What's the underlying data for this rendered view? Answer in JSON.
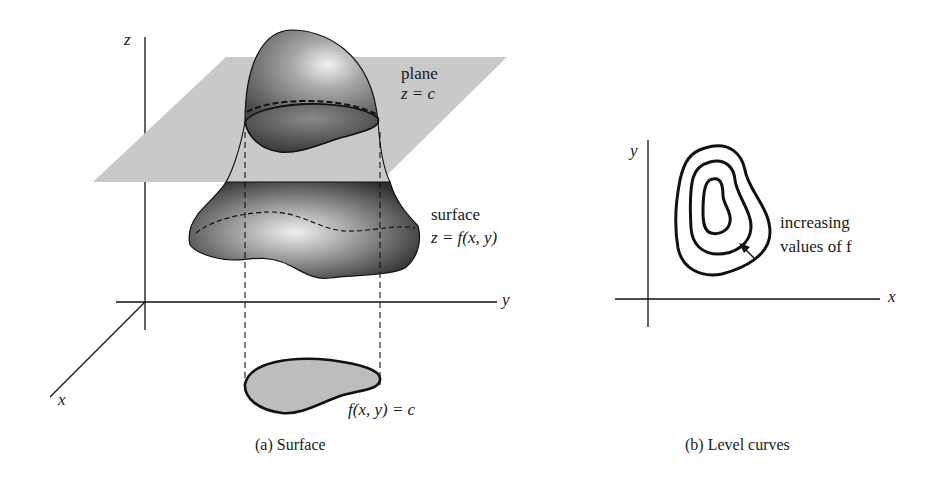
{
  "figure": {
    "panel_a": {
      "caption": "(a) Surface",
      "axes": {
        "z_label": "z",
        "y_label": "y",
        "x_label": "x"
      },
      "plane_label": "plane",
      "plane_equation": "z = c",
      "surface_label": "surface",
      "surface_equation": "z = f(x, y)",
      "level_curve_equation": "f(x, y) = c"
    },
    "panel_b": {
      "caption": "(b) Level curves",
      "axes": {
        "y_label": "y",
        "x_label": "x"
      },
      "annotation_line1": "increasing",
      "annotation_line2": "values of f",
      "contour_count": 3
    },
    "colors": {
      "plane_fill": "#c9c9c9",
      "surface_dark": "#3a3a3a",
      "surface_light": "#d8d8d8",
      "level_region_fill": "#bdbdbd",
      "line": "#111111"
    }
  }
}
